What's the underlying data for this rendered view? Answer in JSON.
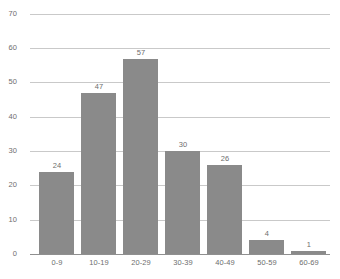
{
  "chart_data": {
    "type": "bar",
    "title": "",
    "subtitle": "",
    "xlabel": "",
    "ylabel": "",
    "categories": [
      "0-9",
      "10-19",
      "20-29",
      "30-39",
      "40-49",
      "50-59",
      "60-69"
    ],
    "values": [
      24,
      47,
      57,
      30,
      26,
      4,
      1
    ],
    "value_labels": [
      "24",
      "47",
      "57",
      "30",
      "26",
      "4",
      "1"
    ],
    "ylim": [
      0,
      70
    ],
    "ytick_values": [
      0,
      10,
      20,
      30,
      40,
      50,
      60,
      70
    ],
    "ytick_labels": [
      "0",
      "10",
      "20",
      "30",
      "40",
      "50",
      "60",
      "70"
    ],
    "grid": true,
    "grid_axis": "y",
    "legend": false,
    "legend_position": "none",
    "orientation": "vertical",
    "bar_color": "#8a8a8a",
    "gridline_color": "#c9c9c9",
    "axis_color": "#8f8f8f",
    "text_color": "#6e6e6e",
    "background_color": "#ffffff"
  }
}
